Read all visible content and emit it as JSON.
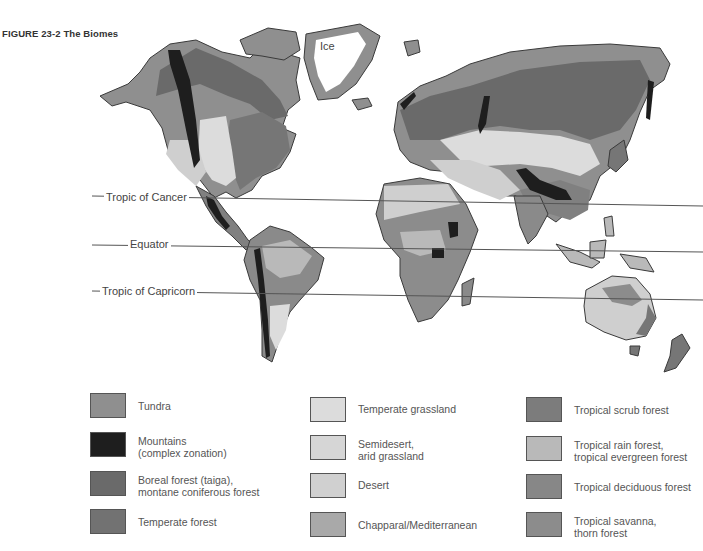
{
  "figure": {
    "caption": "FIGURE 23-2  The Biomes"
  },
  "map": {
    "labels": {
      "ice": "Ice",
      "tropic_of_cancer": "Tropic of Cancer",
      "equator": "Equator",
      "tropic_of_capricorn": "Tropic of Capricorn"
    },
    "colors": {
      "tundra": "#8f8f8f",
      "mountains": "#1e1e1e",
      "boreal": "#6a6a6a",
      "temperate_forest": "#767676",
      "temperate_grassland": "#dcdcdc",
      "semidesert": "#d6d6d6",
      "desert": "#cfcfcf",
      "chaparral": "#a9a9a9",
      "tropical_scrub": "#808080",
      "tropical_rain": "#b9b9b9",
      "tropical_deciduous": "#8a8a8a",
      "tropical_savanna": "#8c8c8c",
      "ice": "#ffffff",
      "outline": "#3a3a3a"
    }
  },
  "legend": {
    "columns": [
      {
        "items": [
          {
            "label": "Tundra",
            "color": "#8f8f8f"
          },
          {
            "label": "Mountains\n(complex zonation)",
            "color": "#1e1e1e"
          },
          {
            "label": "Boreal forest (taiga),\nmontane coniferous forest",
            "color": "#6a6a6a"
          },
          {
            "label": "Temperate forest",
            "color": "#727272"
          }
        ]
      },
      {
        "items": [
          {
            "label": "Temperate grassland",
            "color": "#dcdcdc"
          },
          {
            "label": "Semidesert,\narid grassland",
            "color": "#d6d6d6"
          },
          {
            "label": "Desert",
            "color": "#d0d0d0"
          },
          {
            "label": "Chapparal/Mediterranean",
            "color": "#a9a9a9"
          }
        ]
      },
      {
        "items": [
          {
            "label": "Tropical scrub forest",
            "color": "#7c7c7c"
          },
          {
            "label": "Tropical rain forest,\ntropical evergreen forest",
            "color": "#b9b9b9"
          },
          {
            "label": "Tropical deciduous forest",
            "color": "#878787"
          },
          {
            "label": "Tropical savanna,\nthorn forest",
            "color": "#8c8c8c"
          }
        ]
      }
    ]
  }
}
